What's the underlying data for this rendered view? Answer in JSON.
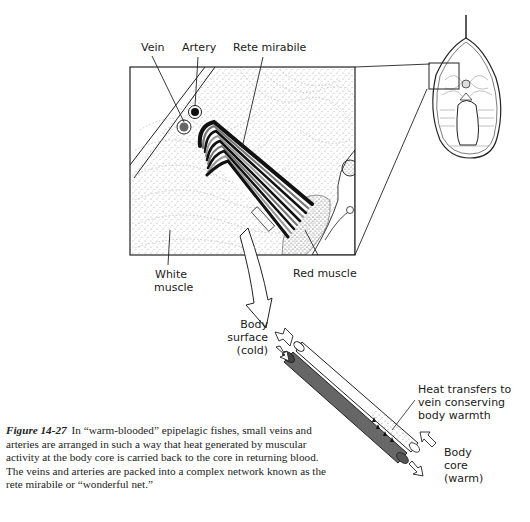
{
  "figure": {
    "number": "Figure 14-27",
    "caption": "In “warm-blooded” epipelagic fishes, small veins and arteries are arranged in such a way that heat generated by muscular activity at the body core is carried back to the core in returning blood. The veins and arteries are packed into a complex network known as the rete mirabile or “wonderful net.”"
  },
  "detail_panel": {
    "labels": {
      "vein": "Vein",
      "artery": "Artery",
      "rete_mirabile": "Rete mirabile",
      "white_muscle_line1": "White",
      "white_muscle_line2": "muscle",
      "red_muscle": "Red muscle"
    }
  },
  "tube_diagram": {
    "labels": {
      "body_surface_line1": "Body",
      "body_surface_line2": "surface",
      "body_surface_line3": "(cold)",
      "heat_line1": "Heat transfers to",
      "heat_line2": "vein conserving",
      "heat_line3": "body warmth",
      "body_core_line1": "Body",
      "body_core_line2": "core",
      "body_core_line3": "(warm)"
    }
  },
  "colors": {
    "ink": "#1a1a1a",
    "stipple": "#9a9a9a",
    "vein_fill": "#555555",
    "paper": "#ffffff"
  }
}
